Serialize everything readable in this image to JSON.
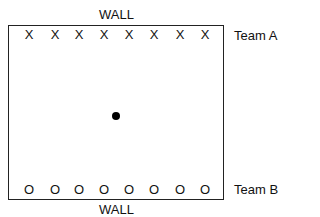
{
  "diagram": {
    "walls": {
      "top": "WALL",
      "bottom": "WALL"
    },
    "team_a": {
      "label": "Team A",
      "marker": "X",
      "players": [
        "X",
        "X",
        "X",
        "X",
        "X",
        "X",
        "X",
        "X"
      ],
      "x_positions": [
        29,
        55,
        79,
        104,
        129,
        154,
        180,
        205
      ]
    },
    "team_b": {
      "label": "Team B",
      "marker": "O",
      "players": [
        "O",
        "O",
        "O",
        "O",
        "O",
        "O",
        "O",
        "O"
      ],
      "x_positions": [
        29,
        55,
        79,
        104,
        129,
        154,
        180,
        205
      ]
    },
    "ball": {
      "shape": "filled-circle",
      "color": "#000000"
    },
    "colors": {
      "line": "#222222",
      "background": "#ffffff"
    }
  }
}
